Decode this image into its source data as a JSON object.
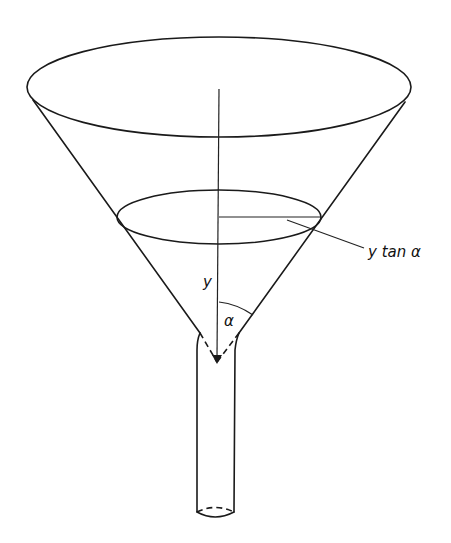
{
  "figure": {
    "labels": {
      "height": "y",
      "radius": "y tan α",
      "angle": "α"
    },
    "colors": {
      "line": "#1a1a1a",
      "background": "#ffffff"
    }
  }
}
